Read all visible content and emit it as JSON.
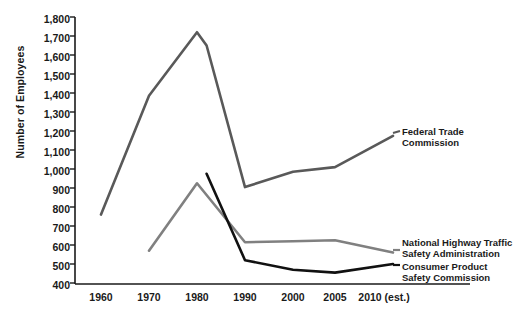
{
  "chart_data": {
    "type": "line",
    "title": "",
    "xlabel": "",
    "ylabel": "Number of Employees",
    "ylim": [
      400,
      1800
    ],
    "ytick_labels": [
      "1,800",
      "1,700",
      "1,600",
      "1,500",
      "1,400",
      "1,300",
      "1,200",
      "1,100",
      "1,000",
      "900",
      "800",
      "700",
      "600",
      "500",
      "400"
    ],
    "ytick_values": [
      1800,
      1700,
      1600,
      1500,
      1400,
      1300,
      1200,
      1100,
      1000,
      900,
      800,
      700,
      600,
      500,
      400
    ],
    "categories": [
      "1960",
      "1970",
      "1980",
      "1990",
      "2000",
      "2005",
      "2010 (est.)"
    ],
    "x_values": [
      1960,
      1970,
      1980,
      1990,
      2000,
      2005,
      2010
    ],
    "grid": false,
    "legend_position": "right-inline",
    "series": [
      {
        "name": "Federal Trade Commission",
        "color": "#595959",
        "x": [
          1960,
          1970,
          1980,
          1982,
          1990,
          2000,
          2005,
          2010
        ],
        "values": [
          760,
          1385,
          1720,
          1650,
          905,
          985,
          1010,
          1175
        ]
      },
      {
        "name": "National Highway Traffic Safety Administration",
        "color": "#808080",
        "x": [
          1970,
          1980,
          1990,
          2000,
          2005,
          2010
        ],
        "values": [
          570,
          925,
          615,
          620,
          625,
          560
        ]
      },
      {
        "name": "Consumer Product Safety Commission",
        "color": "#111111",
        "x": [
          1982,
          1990,
          2000,
          2005,
          2010
        ],
        "values": [
          975,
          520,
          470,
          455,
          500
        ]
      }
    ],
    "annotations": [
      {
        "id": "ftc",
        "lines": [
          "Federal Trade",
          "Commission"
        ]
      },
      {
        "id": "nhtsa",
        "lines": [
          "National Highway Traffic",
          "Safety Administration"
        ]
      },
      {
        "id": "cpsc",
        "lines": [
          "Consumer Product",
          "Safety Commission"
        ]
      }
    ],
    "axis_color": "#1a1a1a"
  }
}
